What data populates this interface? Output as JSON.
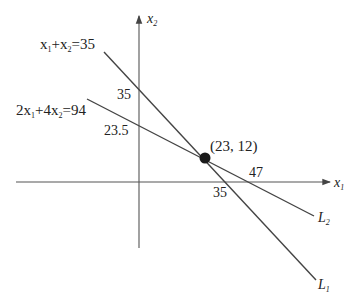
{
  "diagram": {
    "title": "",
    "axes": {
      "x_label": "x",
      "x_sub": "1",
      "y_label": "x",
      "y_sub": "2"
    },
    "lines": [
      {
        "id": "L1",
        "label": "L",
        "label_sub": "1",
        "equation_parts": [
          "x",
          "1",
          "+x",
          "2",
          "=35"
        ],
        "x_intercept": "35",
        "y_intercept": "35"
      },
      {
        "id": "L2",
        "label": "L",
        "label_sub": "2",
        "equation_parts": [
          "2x",
          "1",
          "+4x",
          "2",
          "=94"
        ],
        "x_intercept": "47",
        "y_intercept": "23.5"
      }
    ],
    "intersection": {
      "label": "(23, 12)",
      "x": 23,
      "y": 12
    },
    "colors": {
      "line": "#444444",
      "point": "#1a1a1a"
    }
  }
}
